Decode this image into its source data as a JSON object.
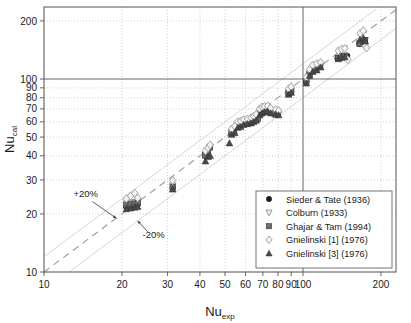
{
  "chart_data": {
    "type": "scatter",
    "title": "",
    "xlabel": "Nu_exp",
    "ylabel": "Nu_cal",
    "xlabel_base": "Nu",
    "xlabel_sub": "exp",
    "ylabel_base": "Nu",
    "ylabel_sub": "cal",
    "xscale": "log",
    "yscale": "log",
    "xlim": [
      10,
      230
    ],
    "ylim": [
      10,
      230
    ],
    "xticks": [
      10,
      20,
      30,
      40,
      50,
      60,
      70,
      80,
      90,
      100,
      200
    ],
    "yticks": [
      10,
      20,
      30,
      40,
      50,
      60,
      70,
      80,
      90,
      100,
      200
    ],
    "xtick_labels": [
      "10",
      "20",
      "30",
      "40",
      "50",
      "60",
      "70",
      "80",
      "90",
      "100",
      "200"
    ],
    "ytick_labels": [
      "10",
      "20",
      "30",
      "40",
      "50",
      "60",
      "70",
      "80",
      "90",
      "100",
      "200"
    ],
    "grid": true,
    "grid_style": "dotted",
    "emphasized_gridlines": [
      100
    ],
    "legend_position": "lower-right",
    "reference_lines": [
      {
        "name": "parity",
        "label": "",
        "style": "dashed",
        "slope": 1.0,
        "offset": 1.0
      },
      {
        "name": "plus20",
        "label": "+20%",
        "style": "solid-light",
        "slope": 1.0,
        "offset": 1.2
      },
      {
        "name": "minus20",
        "label": "-20%",
        "style": "solid-light",
        "slope": 1.0,
        "offset": 0.8
      }
    ],
    "annotations": [
      {
        "text": "+20%",
        "x": 14.5,
        "y": 24.5,
        "arrow_to_x": 19.0,
        "arrow_to_y": 19.0
      },
      {
        "text": "-20%",
        "x": 26.5,
        "y": 15.0,
        "arrow_to_x": 23.0,
        "arrow_to_y": 18.4
      }
    ],
    "series": [
      {
        "name": "Sieder & Tate (1936)",
        "marker": "filled-circle",
        "color": "#1a1a1a",
        "points": [
          [
            20.8,
            21.8
          ],
          [
            21.6,
            22.0
          ],
          [
            22.4,
            22.2
          ],
          [
            23.0,
            22.4
          ],
          [
            31.4,
            27.2
          ],
          [
            42.0,
            40.0
          ],
          [
            42.8,
            41.0
          ],
          [
            43.6,
            44.0
          ],
          [
            53.0,
            52.0
          ],
          [
            54.0,
            53.0
          ],
          [
            55.0,
            56.5
          ],
          [
            56.5,
            57.0
          ],
          [
            58.0,
            58.5
          ],
          [
            60.0,
            59.0
          ],
          [
            62.0,
            59.5
          ],
          [
            63.0,
            60.0
          ],
          [
            64.0,
            61.0
          ],
          [
            66.0,
            62.0
          ],
          [
            67.5,
            65.5
          ],
          [
            69.0,
            67.0
          ],
          [
            70.5,
            68.0
          ],
          [
            72.0,
            68.5
          ],
          [
            73.5,
            69.5
          ],
          [
            75.0,
            67.0
          ],
          [
            78.0,
            66.0
          ],
          [
            80.0,
            65.5
          ],
          [
            88.0,
            84.0
          ],
          [
            90.0,
            86.0
          ],
          [
            103.0,
            97.0
          ],
          [
            105.0,
            105.0
          ],
          [
            108.0,
            110.0
          ],
          [
            112.0,
            112.0
          ],
          [
            116.0,
            116.0
          ],
          [
            136.0,
            128.0
          ],
          [
            140.0,
            130.0
          ],
          [
            144.0,
            131.0
          ],
          [
            148.0,
            132.0
          ],
          [
            165.0,
            152.0
          ],
          [
            170.0,
            156.0
          ],
          [
            173.0,
            158.0
          ]
        ]
      },
      {
        "name": "Colburn (1933)",
        "marker": "open-down-triangle",
        "color": "#8c8c8c",
        "points": [
          [
            20.8,
            22.6
          ],
          [
            21.6,
            22.8
          ],
          [
            22.4,
            23.0
          ],
          [
            23.0,
            23.2
          ],
          [
            31.4,
            28.0
          ],
          [
            42.0,
            40.5
          ],
          [
            43.0,
            42.0
          ],
          [
            43.8,
            44.5
          ],
          [
            53.0,
            53.0
          ],
          [
            54.5,
            54.5
          ],
          [
            56.0,
            57.5
          ],
          [
            57.5,
            58.0
          ],
          [
            59.0,
            59.0
          ],
          [
            61.0,
            59.8
          ],
          [
            63.0,
            60.2
          ],
          [
            64.5,
            61.0
          ],
          [
            66.0,
            62.5
          ],
          [
            68.0,
            66.5
          ],
          [
            69.5,
            68.0
          ],
          [
            71.0,
            69.0
          ],
          [
            73.0,
            69.8
          ],
          [
            75.0,
            68.0
          ],
          [
            78.5,
            67.0
          ],
          [
            80.5,
            66.0
          ],
          [
            88.0,
            85.0
          ],
          [
            90.0,
            87.0
          ],
          [
            103.0,
            98.0
          ],
          [
            106.0,
            106.0
          ],
          [
            109.0,
            111.0
          ],
          [
            113.0,
            113.0
          ],
          [
            117.0,
            117.0
          ],
          [
            137.0,
            129.0
          ],
          [
            141.0,
            131.0
          ],
          [
            145.0,
            132.0
          ],
          [
            166.0,
            153.0
          ],
          [
            171.0,
            157.0
          ],
          [
            174.0,
            159.0
          ]
        ]
      },
      {
        "name": "Ghajar & Tam (1994)",
        "marker": "filled-square",
        "color": "#6e6e6e",
        "points": [
          [
            20.8,
            22.2
          ],
          [
            21.6,
            22.4
          ],
          [
            22.4,
            22.6
          ],
          [
            23.0,
            22.8
          ],
          [
            31.4,
            27.6
          ],
          [
            42.0,
            40.2
          ],
          [
            42.9,
            41.5
          ],
          [
            43.7,
            44.2
          ],
          [
            53.0,
            52.5
          ],
          [
            54.2,
            53.5
          ],
          [
            55.5,
            57.0
          ],
          [
            57.0,
            57.5
          ],
          [
            58.5,
            58.8
          ],
          [
            60.5,
            59.4
          ],
          [
            62.5,
            59.9
          ],
          [
            63.5,
            60.5
          ],
          [
            65.0,
            61.5
          ],
          [
            67.0,
            62.2
          ],
          [
            68.5,
            66.0
          ],
          [
            70.0,
            67.5
          ],
          [
            71.5,
            68.5
          ],
          [
            73.0,
            69.0
          ],
          [
            74.5,
            67.5
          ],
          [
            77.0,
            66.5
          ],
          [
            79.5,
            65.8
          ],
          [
            88.0,
            84.5
          ],
          [
            90.0,
            86.5
          ],
          [
            103.0,
            97.5
          ],
          [
            106.0,
            105.5
          ],
          [
            109.0,
            110.5
          ],
          [
            112.5,
            112.5
          ],
          [
            116.5,
            116.5
          ],
          [
            136.5,
            128.5
          ],
          [
            140.5,
            130.5
          ],
          [
            144.5,
            131.5
          ],
          [
            165.5,
            152.5
          ],
          [
            170.5,
            156.5
          ],
          [
            173.5,
            158.5
          ]
        ]
      },
      {
        "name": "Gnielinski [1] (1976)",
        "marker": "open-diamond",
        "color": "#9a9a9a",
        "points": [
          [
            20.8,
            24.0
          ],
          [
            21.6,
            24.8
          ],
          [
            22.4,
            25.6
          ],
          [
            23.0,
            24.2
          ],
          [
            31.4,
            29.8
          ],
          [
            42.0,
            42.5
          ],
          [
            43.0,
            44.0
          ],
          [
            43.8,
            45.5
          ],
          [
            53.0,
            55.0
          ],
          [
            54.5,
            57.0
          ],
          [
            56.0,
            60.0
          ],
          [
            57.5,
            60.5
          ],
          [
            59.0,
            61.5
          ],
          [
            61.0,
            62.0
          ],
          [
            63.0,
            63.0
          ],
          [
            64.5,
            64.0
          ],
          [
            66.0,
            65.5
          ],
          [
            68.0,
            70.0
          ],
          [
            69.5,
            71.5
          ],
          [
            71.0,
            72.0
          ],
          [
            73.0,
            72.5
          ],
          [
            75.0,
            70.5
          ],
          [
            78.5,
            69.5
          ],
          [
            80.5,
            68.5
          ],
          [
            88.0,
            89.0
          ],
          [
            90.0,
            91.0
          ],
          [
            103.0,
            102.0
          ],
          [
            106.0,
            112.0
          ],
          [
            109.0,
            118.0
          ],
          [
            113.0,
            120.0
          ],
          [
            117.0,
            122.0
          ],
          [
            137.0,
            140.0
          ],
          [
            141.0,
            143.0
          ],
          [
            145.0,
            144.0
          ],
          [
            149.0,
            126.0
          ],
          [
            166.0,
            172.0
          ],
          [
            171.0,
            178.0
          ],
          [
            174.0,
            148.0
          ],
          [
            176.0,
            145.0
          ]
        ]
      },
      {
        "name": "Gnielinski [3] (1976)",
        "marker": "filled-up-triangle",
        "color": "#4a4a4a",
        "points": [
          [
            20.8,
            21.2
          ],
          [
            21.6,
            21.4
          ],
          [
            22.4,
            21.6
          ],
          [
            23.0,
            21.8
          ],
          [
            31.4,
            26.8
          ],
          [
            42.0,
            37.5
          ],
          [
            43.0,
            39.5
          ],
          [
            43.8,
            40.0
          ],
          [
            52.0,
            46.5
          ],
          [
            53.0,
            51.5
          ],
          [
            54.5,
            52.5
          ],
          [
            56.0,
            56.0
          ],
          [
            57.5,
            56.5
          ],
          [
            59.0,
            58.0
          ],
          [
            61.0,
            58.5
          ],
          [
            63.0,
            59.0
          ],
          [
            64.5,
            60.0
          ],
          [
            66.0,
            61.0
          ],
          [
            68.0,
            65.0
          ],
          [
            69.5,
            66.5
          ],
          [
            71.0,
            67.5
          ],
          [
            73.0,
            68.0
          ],
          [
            75.0,
            66.5
          ],
          [
            78.5,
            65.5
          ],
          [
            80.5,
            65.0
          ],
          [
            88.0,
            83.0
          ],
          [
            90.0,
            85.0
          ],
          [
            103.0,
            95.0
          ],
          [
            106.0,
            104.0
          ],
          [
            109.0,
            109.0
          ],
          [
            113.0,
            111.0
          ],
          [
            117.0,
            115.0
          ],
          [
            137.0,
            127.0
          ],
          [
            141.0,
            129.0
          ],
          [
            145.0,
            130.0
          ],
          [
            166.0,
            160.0
          ],
          [
            171.0,
            163.0
          ],
          [
            174.0,
            157.0
          ]
        ]
      }
    ]
  },
  "axes": {
    "y_label_base": "Nu",
    "y_label_sub": "cal",
    "x_label_base": "Nu",
    "x_label_sub": "exp"
  },
  "legend": {
    "items": [
      {
        "label": "Sieder & Tate (1936)",
        "marker": "filled-circle"
      },
      {
        "label": "Colburn (1933)",
        "marker": "open-down-triangle"
      },
      {
        "label": "Ghajar & Tam (1994)",
        "marker": "filled-square"
      },
      {
        "label": "Gnielinski [1] (1976)",
        "marker": "open-diamond"
      },
      {
        "label": "Gnielinski [3] (1976)",
        "marker": "filled-up-triangle"
      }
    ]
  },
  "annotations": {
    "plus20_label": "+20%",
    "minus20_label": "-20%"
  },
  "colors": {
    "axis": "#555555",
    "grid": "#bdbdbd",
    "emphasis": "#555555",
    "parity": "#9a9a9a",
    "band": "#d8d8d8",
    "text": "#1a1a1a"
  }
}
